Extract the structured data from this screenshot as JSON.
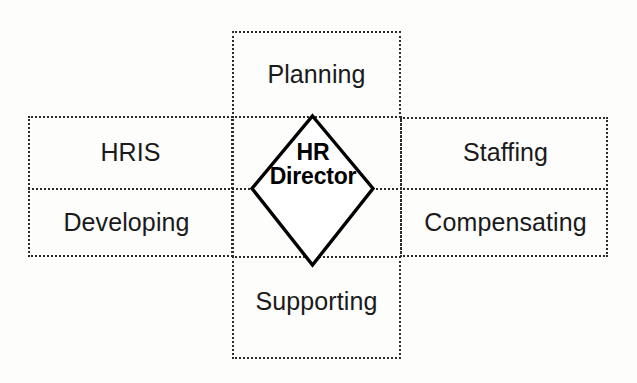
{
  "diagram": {
    "type": "cross-matrix",
    "center": {
      "line1": "HR",
      "line2": "Director",
      "shape": "diamond"
    },
    "cells": {
      "top": "Planning",
      "bottom": "Supporting",
      "left_top": "HRIS",
      "left_bottom": "Developing",
      "right_top": "Staffing",
      "right_bottom": "Compensating"
    },
    "colors": {
      "stroke": "#2b2b2b",
      "diamond_stroke": "#000000",
      "background": "#fdfdfc",
      "text": "#1a1a1a"
    }
  }
}
